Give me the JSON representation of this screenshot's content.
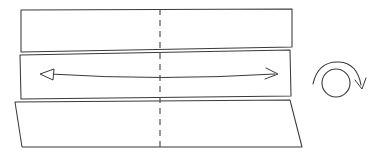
{
  "figure": {
    "kind": "technical-line-drawing",
    "canvas": {
      "width": 383,
      "height": 155,
      "background": "#ffffff"
    },
    "palette": {
      "line": "#3a3a3a",
      "line_light": "#4a4a4a",
      "fill": "#ffffff",
      "background": "#ffffff"
    }
  },
  "panels": [
    {
      "id": "top-panel",
      "label": "Top layer strip",
      "points": "21,10 292,9 292,47 21,52",
      "interactable": false
    },
    {
      "id": "middle-panel",
      "label": "Middle layer strip",
      "points": "20,55 290,50 291,96 21,99",
      "interactable": false
    },
    {
      "id": "bottom-panel",
      "label": "Bottom layer strip",
      "points": "15,102 290,100 302,147 22,147",
      "interactable": false
    }
  ],
  "fold": {
    "id": "accordion-fold",
    "label": "Accordion fold detail at right edge",
    "segments": [
      "292,27 298,33 293,53 289,60 296,66 291,78",
      "292,27 296,31 297,52 292,58 299,64 294,76",
      "298,33 303,47 303,74 296,66",
      "291,78 297,84 302,100"
    ],
    "interactable": false
  },
  "center_line": {
    "id": "center-dashed-line",
    "label": "Vertical dashed center line",
    "x": 160,
    "y_top": 9,
    "y_bottom": 147,
    "dash": "6 5",
    "interactable": false
  },
  "double_arrow": {
    "id": "bidirectional-arrow",
    "label": "Bidirectional stretch arrow",
    "shaft_path": "M 50,74 Q 160,81 275,74",
    "left_head": {
      "style": "open-triangle",
      "points": "40,74 54,69 53,80"
    },
    "right_head": {
      "style": "v-chevron",
      "path": "M 266,68 L 278,74 L 265,79"
    },
    "interactable": false
  },
  "rotation_indicator": {
    "id": "rotation-arrow",
    "label": "Curved rotation arrow",
    "circle": {
      "cx": 336,
      "cy": 83,
      "r": 14
    },
    "arc_path": "M 313,84 Q 318,61 339,62 Q 357,63 361,85",
    "head_path": "M 355,80 L 362,89 L 366,78",
    "interactable": false
  }
}
